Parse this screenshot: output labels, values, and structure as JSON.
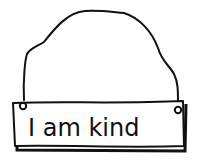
{
  "sign": {
    "text": "I am kind"
  },
  "colors": {
    "ink": "#111111",
    "background": "#ffffff"
  }
}
